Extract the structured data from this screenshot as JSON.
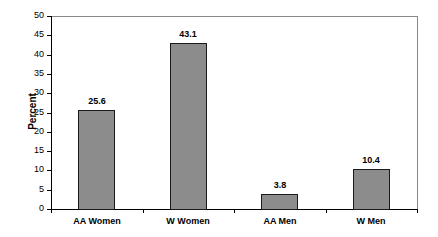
{
  "chart_data": {
    "type": "bar",
    "title": "",
    "xlabel": "",
    "ylabel": "Percent",
    "categories": [
      "AA Women",
      "W Women",
      "AA Men",
      "W Men"
    ],
    "values": [
      25.6,
      43.1,
      3.8,
      10.4
    ],
    "value_labels": [
      "25.6",
      "43.1",
      "3.8",
      "10.4"
    ],
    "ylim": [
      0,
      50
    ],
    "yticks": [
      0,
      5,
      10,
      15,
      20,
      25,
      30,
      35,
      40,
      45,
      50
    ],
    "grid": false,
    "legend": null,
    "bar_color": "#8c8c8c",
    "bar_edge_color": "#1a1a1a"
  }
}
